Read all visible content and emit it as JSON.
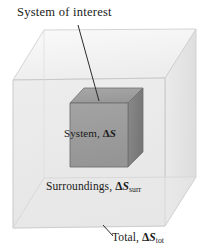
{
  "figure": {
    "title_label": "System of interest",
    "system_label_prefix": "System, ",
    "system_label_delta": "Δ",
    "system_label_symbol": "S",
    "surroundings_label_prefix": "Surroundings, ",
    "surroundings_label_delta": "Δ",
    "surroundings_label_symbol": "S",
    "surroundings_label_subscript": "surr",
    "total_label_prefix": "Total, ",
    "total_label_delta": "Δ",
    "total_label_symbol": "S",
    "total_label_subscript": "tot"
  },
  "colors": {
    "background": "#ffffff",
    "outer_box_front": "#ebebeb",
    "outer_box_top": "#f2f2f2",
    "outer_box_right": "#e3e3e3",
    "outer_box_edge": "#c9c9c9",
    "cube_front": "#9b9b9b",
    "cube_top": "#9f9f9f",
    "cube_right": "#7e7e7e",
    "cube_edge": "#6f6f6f",
    "leader_line": "#2b2b2b",
    "text": "#1a1a1a"
  },
  "geometry": {
    "outer_box": {
      "front_face": [
        [
          13,
          80
        ],
        [
          13,
          228
        ],
        [
          165,
          226
        ],
        [
          165,
          78
        ]
      ],
      "top_face": [
        [
          13,
          80
        ],
        [
          44,
          30
        ],
        [
          196,
          29
        ],
        [
          165,
          78
        ]
      ],
      "right_face": [
        [
          165,
          78
        ],
        [
          196,
          29
        ],
        [
          196,
          177
        ],
        [
          165,
          226
        ]
      ],
      "hidden_back_vertex": [
        44,
        178
      ]
    },
    "cube": {
      "front_face": [
        [
          70,
          103
        ],
        [
          70,
          167
        ],
        [
          128,
          167
        ],
        [
          128,
          103
        ]
      ],
      "top_face": [
        [
          70,
          103
        ],
        [
          84,
          88
        ],
        [
          143,
          88
        ],
        [
          128,
          103
        ]
      ],
      "right_face": [
        [
          128,
          103
        ],
        [
          143,
          88
        ],
        [
          143,
          152
        ],
        [
          128,
          167
        ]
      ]
    },
    "leader_lines": [
      {
        "name": "system-of-interest-leader",
        "from": [
          78,
          25
        ],
        "to": [
          99,
          101
        ]
      },
      {
        "name": "total-leader",
        "from": [
          103,
          225
        ],
        "to": [
          113,
          236
        ]
      }
    ]
  }
}
